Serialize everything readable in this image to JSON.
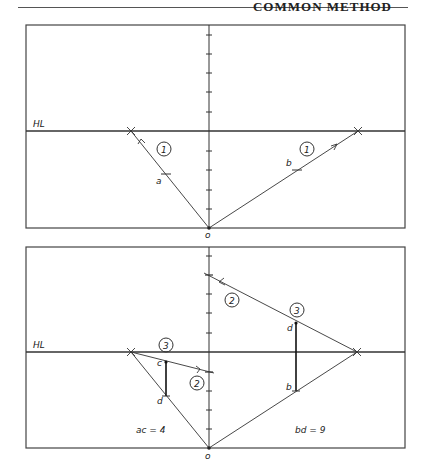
{
  "header": {
    "title": "COMMON METHOD"
  },
  "colors": {
    "line": "#333333",
    "frame": "#444444",
    "text": "#222222",
    "background": "#ffffff"
  },
  "top_panel": {
    "horizon_label": "HL",
    "origin_label": "o",
    "point_a_label": "a",
    "point_b_label": "b",
    "step_left_label": "1",
    "step_right_label": "1"
  },
  "bottom_panel": {
    "horizon_label": "HL",
    "origin_label": "o",
    "point_c_label": "c",
    "point_d_left_label": "d",
    "point_d_right_label": "d",
    "point_b_label": "b",
    "step_2_right_label": "2",
    "step_2_left_label": "2",
    "step_3_left_label": "3",
    "step_3_right_label": "3",
    "measure_left": "ac = 4",
    "measure_right": "bd = 9"
  }
}
